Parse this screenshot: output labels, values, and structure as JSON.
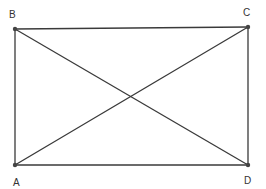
{
  "diagram": {
    "type": "rectangle-with-diagonals",
    "stroke_color": "#3a3a3a",
    "vertices": [
      {
        "label": "A",
        "x": 15,
        "y": 165,
        "label_x": 13,
        "label_y": 186
      },
      {
        "label": "B",
        "x": 15,
        "y": 29,
        "label_x": 9,
        "label_y": 18
      },
      {
        "label": "C",
        "x": 248,
        "y": 27,
        "label_x": 243,
        "label_y": 16
      },
      {
        "label": "D",
        "x": 248,
        "y": 165,
        "label_x": 244,
        "label_y": 184
      }
    ],
    "edges": [
      [
        "A",
        "B"
      ],
      [
        "B",
        "C"
      ],
      [
        "C",
        "D"
      ],
      [
        "D",
        "A"
      ],
      [
        "A",
        "C"
      ],
      [
        "B",
        "D"
      ]
    ]
  }
}
